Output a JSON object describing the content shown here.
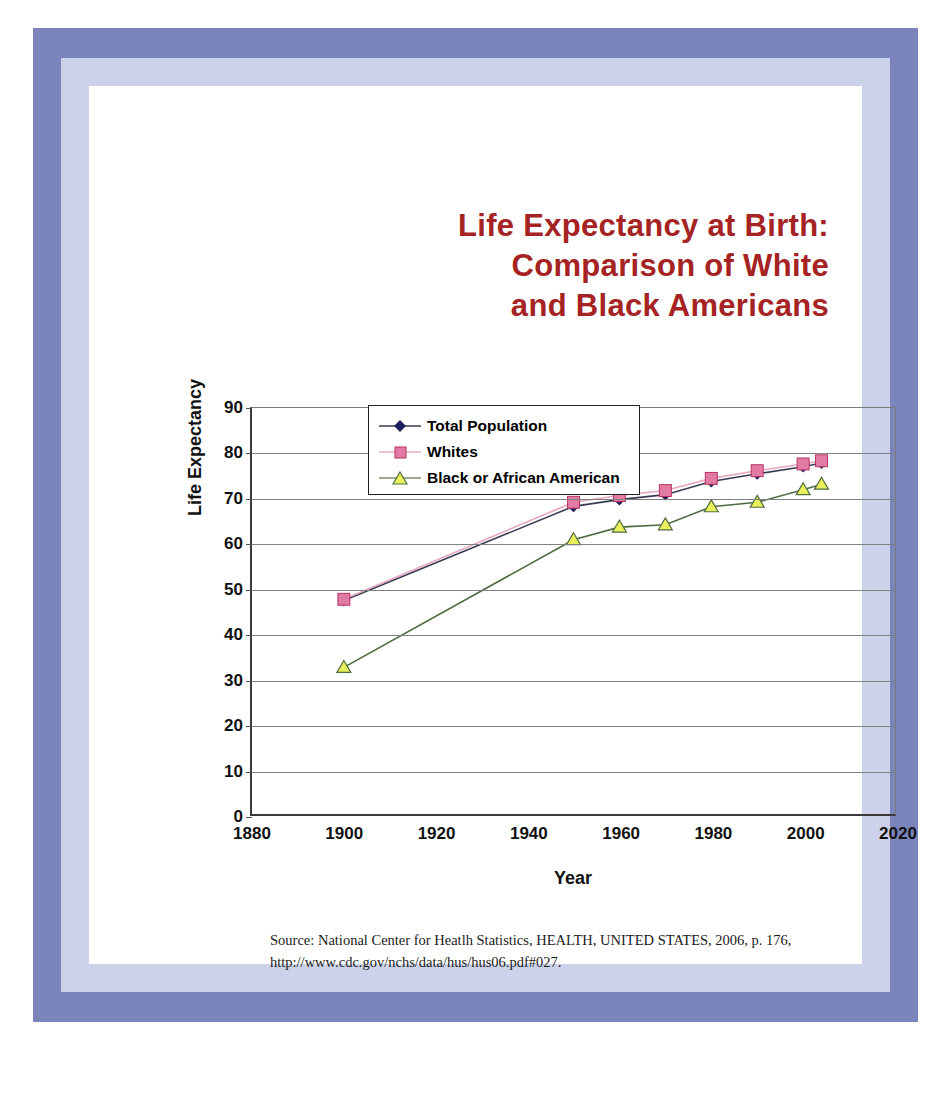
{
  "title": {
    "line1": "Life Expectancy at Birth:",
    "line2": "Comparison of White",
    "line3": "and Black Americans",
    "color": "#a52323"
  },
  "source": {
    "line1": "Source: National Center for Heatlh Statistics, HEALTH, UNITED STATES, 2006, p. 176,",
    "line2": "http://www.cdc.gov/nchs/data/hus/hus06.pdf#027."
  },
  "chart_data": {
    "type": "line",
    "title": "Life Expectancy at Birth: Comparison of White and Black Americans",
    "xlabel": "Year",
    "ylabel": "Life Expectancy",
    "xlim": [
      1880,
      2020
    ],
    "ylim": [
      0,
      90
    ],
    "xticks": [
      1880,
      1900,
      1920,
      1940,
      1960,
      1980,
      2000,
      2020
    ],
    "yticks": [
      0,
      10,
      20,
      30,
      40,
      50,
      60,
      70,
      80,
      90
    ],
    "grid": "horizontal",
    "legend_position": "inside-lower-center",
    "x": [
      1900,
      1950,
      1960,
      1970,
      1980,
      1990,
      2000,
      2004
    ],
    "series": [
      {
        "name": "Total Population",
        "color": "#1f1f5c",
        "line_color": "#3b3b55",
        "marker": "diamond",
        "values": [
          47.3,
          68.2,
          69.7,
          70.8,
          73.7,
          75.4,
          77.0,
          77.8
        ]
      },
      {
        "name": "Whites",
        "color": "#e27ba4",
        "line_color": "#e7a7c0",
        "marker": "square",
        "values": [
          47.6,
          69.1,
          70.6,
          71.7,
          74.4,
          76.1,
          77.6,
          78.3
        ]
      },
      {
        "name": "Black or African American",
        "color": "#e8f05c",
        "line_color": "#4f6b42",
        "marker": "triangle",
        "values": [
          32.5,
          60.8,
          63.6,
          64.1,
          68.1,
          69.1,
          71.9,
          73.1
        ]
      }
    ]
  },
  "legend": {
    "items": [
      {
        "label": "Total Population"
      },
      {
        "label": "Whites"
      },
      {
        "label": "Black or African American"
      }
    ]
  }
}
